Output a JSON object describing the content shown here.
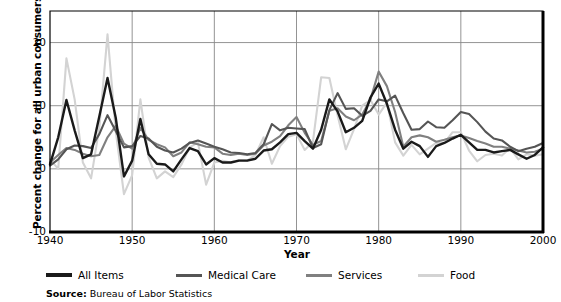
{
  "chart_data": {
    "type": "line",
    "title": "",
    "xlabel": "Year",
    "ylabel": "Percent change for all urban consumers",
    "xlim": [
      1940,
      2000
    ],
    "ylim": [
      -10,
      25
    ],
    "ytick_values": [
      20,
      10,
      0,
      -10
    ],
    "ytick_labels": [
      "20",
      "10",
      "0",
      "-10"
    ],
    "xtick_values": [
      1940,
      1950,
      1960,
      1970,
      1980,
      1990,
      2000
    ],
    "xtick_labels": [
      "1940",
      "1950",
      "1960",
      "1970",
      "1980",
      "1990",
      "2000"
    ],
    "grid": "both",
    "legend_position": "below-axes",
    "source": "Bureau of Labor Statistics",
    "source_prefix": "Source:",
    "x": [
      1940,
      1941,
      1942,
      1943,
      1944,
      1945,
      1946,
      1947,
      1948,
      1949,
      1950,
      1951,
      1952,
      1953,
      1954,
      1955,
      1956,
      1957,
      1958,
      1959,
      1960,
      1961,
      1962,
      1963,
      1964,
      1965,
      1966,
      1967,
      1968,
      1969,
      1970,
      1971,
      1972,
      1973,
      1974,
      1975,
      1976,
      1977,
      1978,
      1979,
      1980,
      1981,
      1982,
      1983,
      1984,
      1985,
      1986,
      1987,
      1988,
      1989,
      1990,
      1991,
      1992,
      1993,
      1994,
      1995,
      1996,
      1997,
      1998,
      1999,
      2000
    ],
    "series": [
      {
        "name": "All Items",
        "color": "#1a1a1a",
        "width": 2.4,
        "values": [
          0.7,
          5.0,
          10.9,
          6.1,
          1.7,
          2.3,
          8.3,
          14.4,
          8.1,
          -1.2,
          1.3,
          7.9,
          2.3,
          0.8,
          0.7,
          -0.4,
          1.5,
          3.3,
          2.8,
          0.7,
          1.7,
          1.0,
          1.0,
          1.3,
          1.3,
          1.6,
          2.9,
          3.1,
          4.2,
          5.5,
          5.7,
          4.4,
          3.2,
          6.2,
          11.0,
          9.1,
          5.8,
          6.5,
          7.6,
          11.3,
          13.5,
          10.3,
          6.2,
          3.2,
          4.3,
          3.6,
          1.9,
          3.6,
          4.1,
          4.8,
          5.4,
          4.2,
          3.0,
          3.0,
          2.6,
          2.8,
          3.0,
          2.3,
          1.6,
          2.2,
          3.4
        ]
      },
      {
        "name": "Medical Care",
        "color": "#555555",
        "width": 2.1,
        "values": [
          0.5,
          1.5,
          3.1,
          3.7,
          3.6,
          3.3,
          5.5,
          8.5,
          6.0,
          3.4,
          3.6,
          5.2,
          4.8,
          3.5,
          2.9,
          2.6,
          3.2,
          4.1,
          4.5,
          4.0,
          3.5,
          3.1,
          2.6,
          2.5,
          2.3,
          2.5,
          3.9,
          7.1,
          6.1,
          6.5,
          6.4,
          6.3,
          3.3,
          3.9,
          9.3,
          12.0,
          9.5,
          9.6,
          8.4,
          9.2,
          11.0,
          10.7,
          11.6,
          8.8,
          6.2,
          6.3,
          7.5,
          6.6,
          6.5,
          7.7,
          9.0,
          8.7,
          7.4,
          5.9,
          4.8,
          4.5,
          3.5,
          2.8,
          3.2,
          3.5,
          4.1
        ]
      },
      {
        "name": "Services",
        "color": "#808080",
        "width": 2.1,
        "values": [
          1.0,
          2.2,
          3.3,
          3.0,
          2.4,
          2.0,
          2.2,
          5.0,
          6.8,
          4.0,
          3.2,
          6.5,
          4.6,
          3.9,
          3.4,
          2.0,
          2.6,
          4.2,
          3.9,
          3.5,
          3.4,
          2.4,
          2.2,
          2.4,
          2.2,
          2.4,
          3.7,
          4.3,
          5.2,
          6.9,
          8.2,
          5.7,
          3.8,
          4.4,
          9.2,
          9.6,
          8.3,
          7.7,
          8.6,
          11.0,
          15.4,
          13.1,
          9.0,
          3.5,
          5.0,
          5.3,
          5.0,
          4.3,
          4.6,
          5.0,
          5.3,
          4.9,
          4.4,
          4.0,
          3.5,
          3.5,
          3.2,
          2.9,
          2.6,
          2.7,
          3.2
        ]
      },
      {
        "name": "Food",
        "color": "#d3d3d3",
        "width": 2.1,
        "values": [
          1.5,
          0.0,
          17.5,
          11.0,
          1.0,
          -1.5,
          6.5,
          21.3,
          6.0,
          -4.0,
          -1.0,
          11.0,
          1.8,
          -1.5,
          -0.4,
          -1.3,
          0.7,
          3.4,
          4.2,
          -2.5,
          1.0,
          1.3,
          1.0,
          1.4,
          1.3,
          2.2,
          5.0,
          0.8,
          3.6,
          5.1,
          5.5,
          3.0,
          4.3,
          14.5,
          14.4,
          8.5,
          3.1,
          6.3,
          10.0,
          10.9,
          8.6,
          10.5,
          4.2,
          2.1,
          3.8,
          2.3,
          3.2,
          4.1,
          4.1,
          5.8,
          5.8,
          2.9,
          1.2,
          2.2,
          2.4,
          2.1,
          3.3,
          1.5,
          2.3,
          2.1,
          2.3
        ]
      }
    ]
  },
  "axes": {
    "plot_left": 50,
    "plot_right": 543,
    "plot_top": 11,
    "plot_bottom": 232
  },
  "legend": {
    "items": [
      {
        "label": "All Items",
        "color": "#1a1a1a"
      },
      {
        "label": "Medical Care",
        "color": "#555555"
      },
      {
        "label": "Services",
        "color": "#808080"
      },
      {
        "label": "Food",
        "color": "#d3d3d3"
      }
    ]
  }
}
